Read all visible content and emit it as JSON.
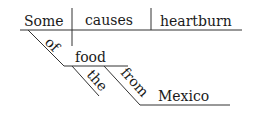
{
  "diagram": {
    "type": "sentence-diagram",
    "sentence": "Some food from Mexico causes heartburn",
    "baseline": {
      "subject": "Some",
      "verb": "causes",
      "object": "heartburn"
    },
    "modifiers": {
      "subject_preposition": "of",
      "preposition_object": "food",
      "article": "the",
      "second_preposition": "from",
      "second_object": "Mexico"
    },
    "colors": {
      "line": "#333333",
      "text": "#1a1a1a"
    }
  }
}
